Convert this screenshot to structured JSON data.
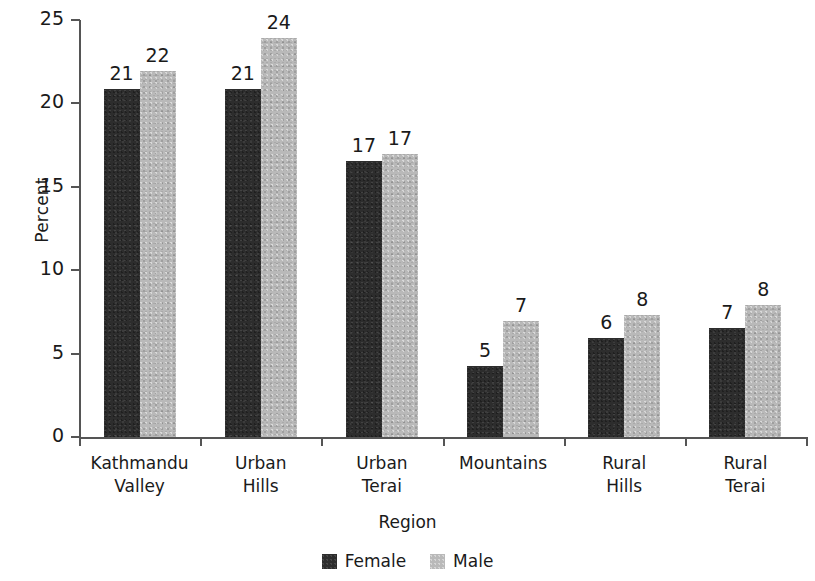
{
  "chart_data": {
    "type": "bar",
    "title": "",
    "xlabel": "Region",
    "ylabel": "Percent",
    "ylim": [
      0,
      25
    ],
    "yticks": [
      0,
      5,
      10,
      15,
      20,
      25
    ],
    "grid": false,
    "legend_position": "bottom",
    "categories": [
      "Kathmandu\nValley",
      "Urban\nHills",
      "Urban\nTerai",
      "Mountains",
      "Rural\nHills",
      "Rural\nTerai"
    ],
    "series": [
      {
        "name": "Female",
        "color": "#2d2d2d",
        "values": [
          20.9,
          20.9,
          16.6,
          4.3,
          6.0,
          6.6
        ],
        "labels": [
          "21",
          "21",
          "17",
          "5",
          "6",
          "7"
        ]
      },
      {
        "name": "Male",
        "color": "#b9b9b9",
        "values": [
          22.0,
          24.0,
          17.0,
          7.0,
          7.4,
          8.0
        ],
        "labels": [
          "22",
          "24",
          "17",
          "7",
          "8",
          "8"
        ]
      }
    ]
  },
  "axes": {
    "y_tick_labels": [
      "25",
      "20",
      "15",
      "10",
      "5",
      "0"
    ],
    "y_title": "Percent",
    "x_title": "Region"
  },
  "legend": {
    "items": [
      {
        "label": "Female",
        "swatch": "female-swatch-icon"
      },
      {
        "label": "Male",
        "swatch": "male-swatch-icon"
      }
    ]
  }
}
